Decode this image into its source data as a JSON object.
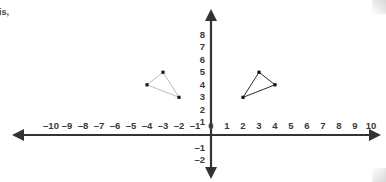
{
  "page": {
    "background_color": "#ffffff",
    "width": 386,
    "height": 182,
    "fragment_text": "is,"
  },
  "chart_data": {
    "type": "scatter",
    "title": "",
    "xlabel": "",
    "ylabel": "",
    "xlim": [
      -11,
      11
    ],
    "ylim": [
      -2.6,
      8.8
    ],
    "grid": false,
    "legend": "none",
    "axis_color": "#333333",
    "tick_label_color": "#3a3a3a",
    "x_ticks": [
      -10,
      -9,
      -8,
      -7,
      -6,
      -5,
      -4,
      -3,
      -2,
      -1,
      0,
      1,
      2,
      3,
      4,
      5,
      6,
      7,
      8,
      9,
      10
    ],
    "x_tick_labels": [
      "–10",
      "–9",
      "–8",
      "–7",
      "–6",
      "–5",
      "–4",
      "–3",
      "–2",
      "–1",
      "0",
      "1",
      "2",
      "3",
      "4",
      "5",
      "6",
      "7",
      "8",
      "9",
      "10"
    ],
    "y_ticks": [
      8,
      7,
      6,
      5,
      4,
      3,
      2,
      1,
      0,
      -1,
      -2
    ],
    "y_tick_labels": [
      "8",
      "7",
      "6",
      "5",
      "4",
      "3",
      "2",
      "1",
      "0",
      "–1",
      "–2"
    ],
    "series": [
      {
        "name": "left-triangle",
        "shape": "triangle",
        "closed": true,
        "stroke_color": "#b4b4b4",
        "stroke_width": 0.9,
        "marker": "square",
        "marker_color": "#1a1a1a",
        "marker_size": 3.2,
        "points": [
          {
            "x": -4,
            "y": 4
          },
          {
            "x": -3,
            "y": 5
          },
          {
            "x": -2,
            "y": 3
          }
        ]
      },
      {
        "name": "right-triangle",
        "shape": "triangle",
        "closed": true,
        "stroke_color": "#2b2b2b",
        "stroke_width": 1.0,
        "marker": "square",
        "marker_color": "#111111",
        "marker_size": 3.2,
        "points": [
          {
            "x": 2,
            "y": 3
          },
          {
            "x": 3,
            "y": 5
          },
          {
            "x": 4,
            "y": 4
          }
        ]
      }
    ]
  }
}
